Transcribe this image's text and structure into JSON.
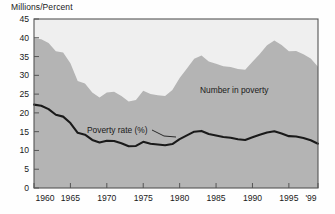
{
  "figure": {
    "axis_label": "Millions/Percent",
    "background": "#fefefe",
    "area_fill": "#b4b4b4",
    "plot_bg": "#efefef",
    "line_color": "#1a1a1a",
    "axis_color": "#555555"
  },
  "annotations": {
    "area_series_label": "Number in poverty",
    "line_series_label": "Poverty rate (%)"
  },
  "axes": {
    "y_ticks": [
      "0",
      "5",
      "10",
      "15",
      "20",
      "25",
      "30",
      "35",
      "40",
      "45"
    ],
    "x_ticks": [
      "1960",
      "1965",
      "1970",
      "1975",
      "1980",
      "1985",
      "1990",
      "1995",
      "'99"
    ]
  },
  "chart_data": {
    "type": "area",
    "title": "",
    "subtitle": "",
    "xlabel": "",
    "ylabel": "Millions/Percent",
    "ylim": [
      0,
      45
    ],
    "xlim": [
      1960,
      1999
    ],
    "grid": false,
    "legend": "inline-annotations",
    "x": [
      1960,
      1961,
      1962,
      1963,
      1964,
      1965,
      1966,
      1967,
      1968,
      1969,
      1970,
      1971,
      1972,
      1973,
      1974,
      1975,
      1976,
      1977,
      1978,
      1979,
      1980,
      1981,
      1982,
      1983,
      1984,
      1985,
      1986,
      1987,
      1988,
      1989,
      1990,
      1991,
      1992,
      1993,
      1994,
      1995,
      1996,
      1997,
      1998,
      1999
    ],
    "series": [
      {
        "name": "Number in poverty",
        "unit": "millions",
        "render": "area",
        "color": "#b4b4b4",
        "values": [
          39.9,
          39.6,
          38.6,
          36.4,
          36.1,
          33.2,
          28.5,
          27.8,
          25.4,
          24.1,
          25.4,
          25.6,
          24.5,
          23.0,
          23.4,
          25.9,
          25.0,
          24.7,
          24.5,
          26.1,
          29.3,
          31.8,
          34.4,
          35.3,
          33.7,
          33.1,
          32.4,
          32.2,
          31.7,
          31.5,
          33.6,
          35.7,
          38.0,
          39.3,
          38.1,
          36.4,
          36.5,
          35.6,
          34.5,
          32.3
        ]
      },
      {
        "name": "Poverty rate (%)",
        "unit": "percent",
        "render": "line",
        "color": "#1a1a1a",
        "values": [
          22.2,
          21.9,
          21.0,
          19.5,
          19.0,
          17.3,
          14.7,
          14.2,
          12.8,
          12.1,
          12.6,
          12.5,
          11.9,
          11.1,
          11.2,
          12.3,
          11.8,
          11.6,
          11.4,
          11.7,
          13.0,
          14.0,
          15.0,
          15.2,
          14.4,
          14.0,
          13.6,
          13.4,
          13.0,
          12.8,
          13.5,
          14.2,
          14.8,
          15.1,
          14.5,
          13.8,
          13.7,
          13.3,
          12.7,
          11.8
        ]
      }
    ]
  }
}
